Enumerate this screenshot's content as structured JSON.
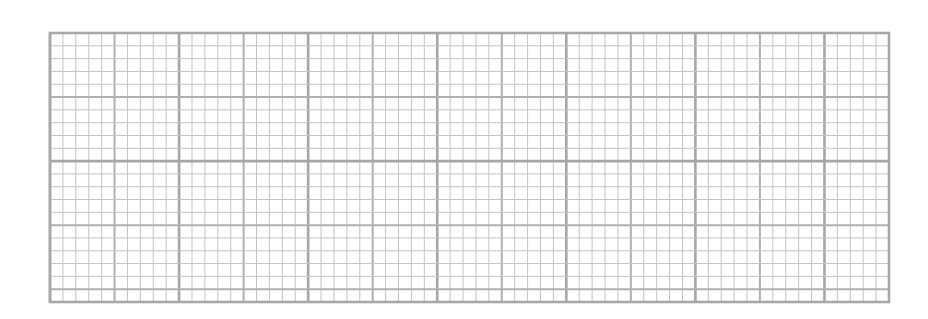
{
  "graph_paper": {
    "left": 50,
    "top": 33,
    "right": 889,
    "bottom": 302,
    "minor_cells_x": 65,
    "minor_cells_y": 21,
    "minor_per_major": 5,
    "heavy_every_major": 2,
    "colors": {
      "minor_line": "#c4c4c4",
      "major_line": "#b0b0b0",
      "heavy_line": "#a6a6a6",
      "border": "#a8a8a8",
      "background": "#ffffff"
    }
  }
}
